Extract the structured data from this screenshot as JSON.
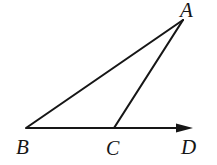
{
  "figure": {
    "type": "euclidean-geometry-diagram",
    "background_color": "#ffffff",
    "stroke_color": "#161616",
    "stroke_width": 2.1,
    "canvas": {
      "width": 217,
      "height": 165
    },
    "points": [
      {
        "id": "A",
        "label": "A",
        "x": 183,
        "y": 20,
        "label_x": 180,
        "label_y": 0
      },
      {
        "id": "B",
        "label": "B",
        "x": 26,
        "y": 128,
        "label_x": 16,
        "label_y": 137
      },
      {
        "id": "C",
        "label": "C",
        "x": 114,
        "y": 128,
        "label_x": 106,
        "label_y": 138
      },
      {
        "id": "D",
        "label": "D",
        "x": 192,
        "y": 128,
        "label_x": 181,
        "label_y": 137
      }
    ],
    "segments": [
      {
        "id": "AB",
        "name": "segment-ab",
        "from": "B",
        "to": "A",
        "arrow": false
      },
      {
        "id": "AC",
        "name": "segment-ac",
        "from": "C",
        "to": "A",
        "arrow": false
      },
      {
        "id": "BD",
        "name": "ray-bd",
        "from": "B",
        "to": "D",
        "arrow": true
      }
    ],
    "arrowhead": {
      "tip_x": 193,
      "base_x": 176,
      "half_height": 4.6
    }
  }
}
